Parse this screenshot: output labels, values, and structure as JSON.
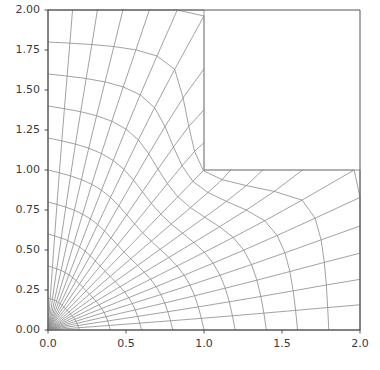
{
  "figure": {
    "title": "",
    "background_color": "#ffffff",
    "axes_edge_color": "#555555",
    "mesh_line_color": "#8a8a8a",
    "tick_label_color": "#3b3b3b"
  },
  "axes": {
    "x": {
      "label": "",
      "min": 0.0,
      "max": 2.0,
      "ticks": [
        0.0,
        0.5,
        1.0,
        1.5,
        2.0
      ],
      "tick_labels": [
        "0.0",
        "0.5",
        "1.0",
        "1.5",
        "2.0"
      ]
    },
    "y": {
      "label": "",
      "min": 0.0,
      "max": 2.0,
      "ticks": [
        0.0,
        0.25,
        0.5,
        0.75,
        1.0,
        1.25,
        1.5,
        1.75,
        2.0
      ],
      "tick_labels": [
        "0.00",
        "0.25",
        "0.50",
        "0.75",
        "1.00",
        "1.25",
        "1.50",
        "1.75",
        "2.00"
      ]
    }
  },
  "chart_data": {
    "type": "line",
    "title": "",
    "xlabel": "",
    "ylabel": "",
    "xlim": [
      0.0,
      2.0
    ],
    "ylim": [
      0.0,
      2.0
    ],
    "grid": false,
    "legend": null,
    "domain_boundary": [
      [
        0.0,
        0.0
      ],
      [
        2.0,
        0.0
      ],
      [
        2.0,
        1.0
      ],
      [
        1.0,
        1.0
      ],
      [
        1.0,
        2.0
      ],
      [
        0.0,
        2.0
      ],
      [
        0.0,
        0.0
      ]
    ],
    "reentrant_corner": [
      1.0,
      1.0
    ],
    "series": [
      {
        "name": "radial-lines-from-origin",
        "values": [
          [
            [
              0.0,
              0.0
            ],
            [
              0.28,
              0.28
            ],
            [
              0.62,
              0.62
            ],
            [
              0.9,
              0.86
            ],
            [
              1.2,
              1.05
            ]
          ],
          [
            [
              0.0,
              0.0
            ],
            [
              0.12,
              0.33
            ],
            [
              0.3,
              0.72
            ],
            [
              0.44,
              1.12
            ],
            [
              0.52,
              1.55
            ],
            [
              0.56,
              2.0
            ]
          ],
          [
            [
              0.0,
              0.0
            ],
            [
              0.33,
              0.12
            ],
            [
              0.72,
              0.3
            ],
            [
              1.12,
              0.44
            ],
            [
              1.55,
              0.52
            ],
            [
              2.0,
              0.56
            ]
          ]
        ]
      },
      {
        "name": "arcs-around-origin",
        "radii": [
          0.4,
          0.8,
          1.2,
          1.6
        ],
        "values": [
          [
            [
              0.0,
              0.4
            ],
            [
              0.2,
              0.35
            ],
            [
              0.33,
              0.22
            ],
            [
              0.4,
              0.0
            ]
          ],
          [
            [
              0.0,
              0.8
            ],
            [
              0.4,
              0.7
            ],
            [
              0.66,
              0.44
            ],
            [
              0.8,
              0.0
            ]
          ],
          [
            [
              0.0,
              1.2
            ],
            [
              0.6,
              1.05
            ],
            [
              1.0,
              0.66
            ],
            [
              1.2,
              0.0
            ]
          ],
          [
            [
              0.0,
              1.6
            ],
            [
              0.8,
              1.4
            ],
            [
              1.4,
              0.88
            ],
            [
              1.6,
              0.0
            ]
          ]
        ]
      },
      {
        "name": "vertical-arm-grid-lines",
        "count_vertical": 10,
        "count_horizontal": 4
      },
      {
        "name": "horizontal-arm-grid-lines",
        "count_vertical": 4,
        "count_horizontal": 10
      }
    ]
  }
}
